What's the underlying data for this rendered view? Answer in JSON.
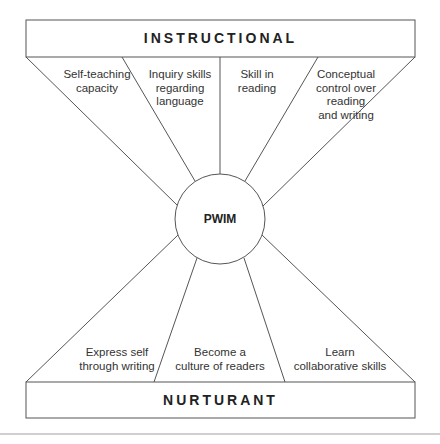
{
  "diagram": {
    "top_box": {
      "title": "INSTRUCTIONAL"
    },
    "bottom_box": {
      "title": "NURTURANT"
    },
    "center": {
      "label": "PWIM"
    },
    "instructional_items": [
      {
        "label": "Self-teaching\ncapacity"
      },
      {
        "label": "Inquiry skills\nregarding\nlanguage"
      },
      {
        "label": "Skill in\nreading"
      },
      {
        "label": "Conceptual\ncontrol over\nreading\nand writing"
      }
    ],
    "nurturant_items": [
      {
        "label": "Express self\nthrough writing"
      },
      {
        "label": "Become a\nculture of readers"
      },
      {
        "label": "Learn\ncollaborative skills"
      }
    ],
    "colors": {
      "line": "#555555",
      "separator": "#cfcfcf"
    }
  }
}
